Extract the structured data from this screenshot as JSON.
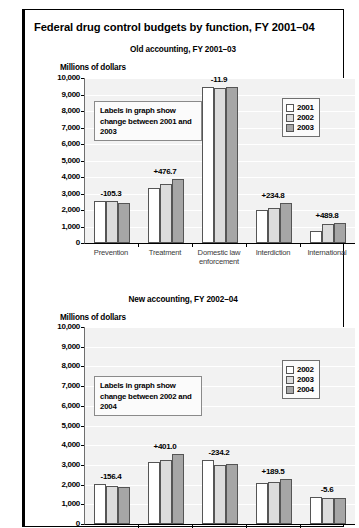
{
  "document": {
    "clipped_header": "",
    "main_title": "Federal drug control budgets by function, FY 2001–04"
  },
  "charts": [
    {
      "subtitle": "Old accounting, FY 2001–03",
      "axis_title": "Millions of dollars",
      "note": "Labels in graph show change between 2001 and 2003",
      "legend": [
        {
          "label": "2001",
          "color": "#ffffff"
        },
        {
          "label": "2002",
          "color": "#dcdcdc"
        },
        {
          "label": "2004",
          "color": "#a6a6a6"
        }
      ],
      "chart_data": {
        "type": "bar",
        "title": "Old accounting, FY 2001–03",
        "xlabel": "",
        "ylabel": "Millions of dollars",
        "ylim": [
          0,
          10000
        ],
        "yticks": [
          "0",
          "1,000",
          "2,000",
          "3,000",
          "4,000",
          "5,000",
          "6,000",
          "7,000",
          "8,000",
          "9,000",
          "10,000"
        ],
        "grid": true,
        "legend_position": "upper-right",
        "categories": [
          "Prevention",
          "Treatment",
          "Domestic law enforcement",
          "Interdiction",
          "International"
        ],
        "series": [
          {
            "name": "2001",
            "color": "#ffffff",
            "values": [
              2550,
              3350,
              9450,
              2000,
              700
            ]
          },
          {
            "name": "2002",
            "color": "#dcdcdc",
            "values": [
              2550,
              3600,
              9400,
              2100,
              1150
            ]
          },
          {
            "name": "2003",
            "color": "#a6a6a6",
            "values": [
              2450,
              3850,
              9440,
              2400,
              1200
            ]
          }
        ],
        "annotations": [
          "-105.3",
          "+476.7",
          "-11.9",
          "+234.8",
          "+489.8"
        ]
      }
    },
    {
      "subtitle": "New accounting, FY 2002–04",
      "axis_title": "Millions of dollars",
      "note": "Labels in graph show change between 2002 and 2004",
      "legend": [
        {
          "label": "2002",
          "color": "#ffffff"
        },
        {
          "label": "2003",
          "color": "#dcdcdc"
        },
        {
          "label": "2004",
          "color": "#a6a6a6"
        }
      ],
      "chart_data": {
        "type": "bar",
        "title": "New accounting, FY 2002–04",
        "xlabel": "",
        "ylabel": "Millions of dollars",
        "ylim": [
          0,
          10000
        ],
        "yticks": [
          "0",
          "1,000",
          "2,000",
          "3,000",
          "4,000",
          "5,000",
          "6,000",
          "7,000",
          "8,000",
          "9,000",
          "10,000"
        ],
        "grid": true,
        "legend_position": "upper-right",
        "categories": [
          "",
          "",
          "",
          "",
          ""
        ],
        "series": [
          {
            "name": "2002",
            "color": "#ffffff",
            "values": [
              2050,
              3150,
              3250,
              2100,
              1350
            ]
          },
          {
            "name": "2003",
            "color": "#dcdcdc",
            "values": [
              1950,
              3250,
              3000,
              2150,
              1300
            ]
          },
          {
            "name": "2004",
            "color": "#a6a6a6",
            "values": [
              1900,
              3550,
              3050,
              2300,
              1300
            ]
          }
        ],
        "annotations": [
          "-156.4",
          "+401.0",
          "-234.2",
          "+189.5",
          "-5.6"
        ]
      }
    }
  ]
}
